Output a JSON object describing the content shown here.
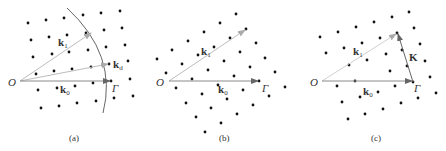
{
  "panels": [
    {
      "id": "a",
      "caption": "(a)",
      "origin_label": "O",
      "gamma_label": "Γ",
      "vectors": [
        {
          "name": "k1",
          "label": "k",
          "sub": "1"
        },
        {
          "name": "kd",
          "label": "k",
          "sub": "d"
        },
        {
          "name": "k0",
          "label": "k",
          "sub": "0"
        }
      ],
      "has_arc": true
    },
    {
      "id": "b",
      "caption": "(b)",
      "origin_label": "O",
      "gamma_label": "Γ",
      "vectors": [
        {
          "name": "k1",
          "label": "k",
          "sub": "1"
        },
        {
          "name": "k0",
          "label": "k",
          "sub": "0"
        }
      ]
    },
    {
      "id": "c",
      "caption": "(c)",
      "origin_label": "O",
      "gamma_label": "Γ",
      "vectors": [
        {
          "name": "k1",
          "label": "k",
          "sub": "1"
        },
        {
          "name": "k0",
          "label": "k",
          "sub": "0"
        },
        {
          "name": "K",
          "label": "K",
          "sub": ""
        }
      ]
    }
  ],
  "colors": {
    "dot": "#111111",
    "vector_light": "#bdbdbd",
    "vector_dark": "#8a8a8a",
    "arc": "#555555",
    "text": "#333333"
  }
}
